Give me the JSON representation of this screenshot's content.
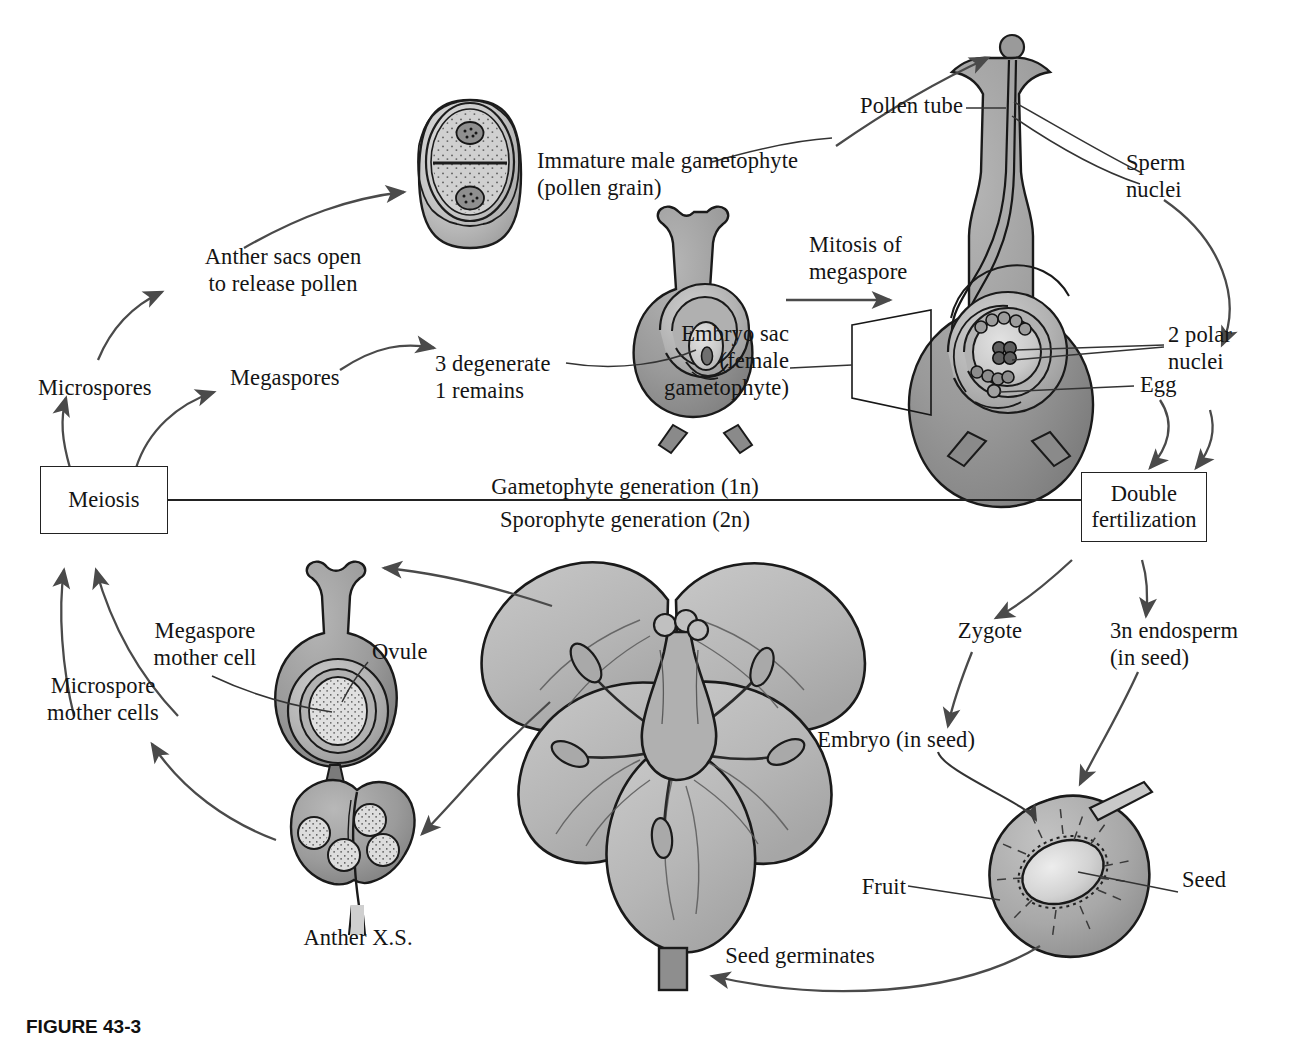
{
  "figure": {
    "caption": "FIGURE 43-3"
  },
  "boxes": [
    {
      "id": "meiosis",
      "label": "Meiosis"
    },
    {
      "id": "double_fertilization",
      "label": "Double\nfertilization"
    }
  ],
  "generation_lines": [
    {
      "id": "gametophyte",
      "label": "Gametophyte generation (1n)"
    },
    {
      "id": "sporophyte",
      "label": "Sporophyte generation (2n)"
    }
  ],
  "labels": [
    {
      "id": "anther-sacs-open",
      "text": "Anther sacs open\nto release pollen"
    },
    {
      "id": "immature-male-gametophyte",
      "text": "Immature male gametophyte\n(pollen grain)"
    },
    {
      "id": "pollen-tube",
      "text": "Pollen tube"
    },
    {
      "id": "sperm-nuclei",
      "text": "Sperm\nnuclei"
    },
    {
      "id": "mitosis-of-megaspore",
      "text": "Mitosis of\nmegaspore"
    },
    {
      "id": "embryo-sac",
      "text": "Embryo sac\n(female\ngametophyte)"
    },
    {
      "id": "two-polar-nuclei",
      "text": "2 polar\nnuclei"
    },
    {
      "id": "egg",
      "text": "Egg"
    },
    {
      "id": "three-degenerate",
      "text": "3 degenerate\n1 remains"
    },
    {
      "id": "megaspores",
      "text": "Megaspores"
    },
    {
      "id": "microspores",
      "text": "Microspores"
    },
    {
      "id": "megaspore-mother-cell",
      "text": "Megaspore\nmother cell"
    },
    {
      "id": "microspore-mother-cells",
      "text": "Microspore\nmother cells"
    },
    {
      "id": "ovule",
      "text": "Ovule"
    },
    {
      "id": "anther-xs",
      "text": "Anther X.S."
    },
    {
      "id": "zygote",
      "text": "Zygote"
    },
    {
      "id": "endosperm",
      "text": "3n endosperm\n(in seed)"
    },
    {
      "id": "embryo-in-seed",
      "text": "Embryo (in seed)"
    },
    {
      "id": "seed",
      "text": "Seed"
    },
    {
      "id": "fruit",
      "text": "Fruit"
    },
    {
      "id": "seed-germinates",
      "text": "Seed germinates"
    }
  ],
  "colors": {
    "ink": "#1a1a1a",
    "arrow": "#4a4a4a",
    "tissue_dark": "#8d8d8d",
    "tissue_mid": "#a8a8a8",
    "tissue_light": "#c4c4c4",
    "tissue_pale": "#d8d8d8",
    "petal": "#b9b9b9",
    "background": "#ffffff"
  }
}
